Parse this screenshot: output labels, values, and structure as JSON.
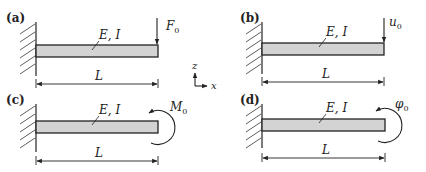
{
  "figure": {
    "colors": {
      "beam_fill": "#d3d3d3",
      "stroke": "#222222",
      "background": "#ffffff"
    },
    "axes": {
      "vertical_label": "z",
      "horizontal_label": "x"
    },
    "panels": [
      {
        "id": "a",
        "label": "(a)",
        "property_label": "E, I",
        "length_label": "L",
        "load_type": "point-force",
        "load_symbol": "F",
        "load_subscript": "0"
      },
      {
        "id": "b",
        "label": "(b)",
        "property_label": "E, I",
        "length_label": "L",
        "load_type": "prescribed-displacement",
        "load_symbol": "u",
        "load_subscript": "0"
      },
      {
        "id": "c",
        "label": "(c)",
        "property_label": "E, I",
        "length_label": "L",
        "load_type": "moment",
        "load_symbol": "M",
        "load_subscript": "0"
      },
      {
        "id": "d",
        "label": "(d)",
        "property_label": "E, I",
        "length_label": "L",
        "load_type": "prescribed-rotation",
        "load_symbol": "φ",
        "load_subscript": "0"
      }
    ]
  }
}
